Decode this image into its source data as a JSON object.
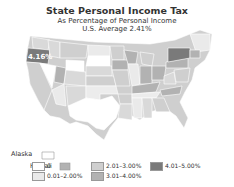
{
  "title": "State Personal Income Tax",
  "subtitle": "As Percentage of Personal Income",
  "average": "U.S. Average 2.41%",
  "callout": "4.16%",
  "insets": {
    "alaska": "Alaska",
    "hawaii": "Hawaii"
  },
  "legend": [
    {
      "label": "0",
      "color": "#ffffff"
    },
    {
      "label": "0.01–2.00%",
      "color": "#eaeaea"
    },
    {
      "label": "2.01–3.00%",
      "color": "#cfcfcf"
    },
    {
      "label": "3.01–4.00%",
      "color": "#b2b2b2"
    },
    {
      "label": "4.01–5.00%",
      "color": "#7a7a7a"
    }
  ]
}
